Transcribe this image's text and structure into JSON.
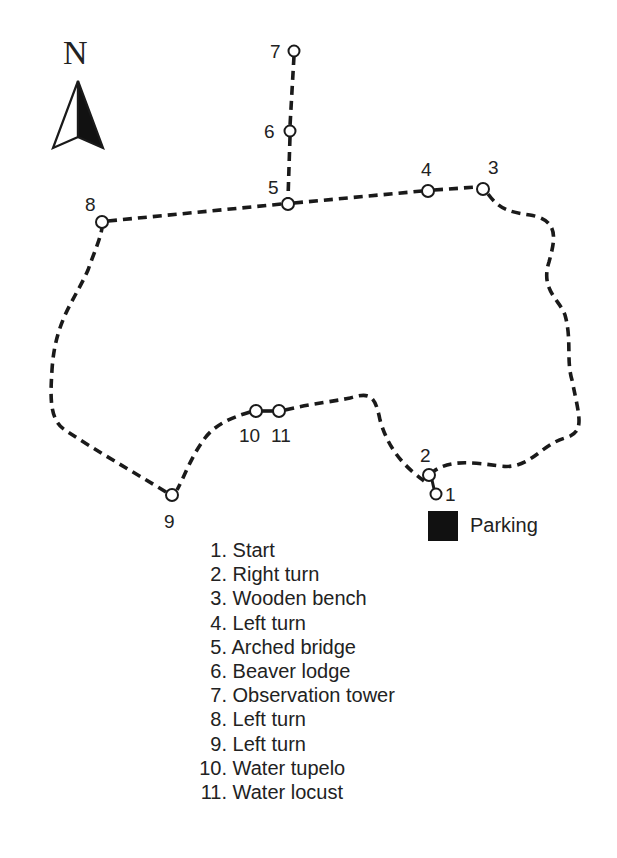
{
  "compass": {
    "label": "N",
    "icon": "north-arrow-icon"
  },
  "trail": {
    "points": [
      {
        "id": "1",
        "label": "1",
        "x": 436,
        "y": 494
      },
      {
        "id": "2",
        "label": "2",
        "x": 429,
        "y": 475
      },
      {
        "id": "3",
        "label": "3",
        "x": 483,
        "y": 189
      },
      {
        "id": "4",
        "label": "4",
        "x": 428,
        "y": 191
      },
      {
        "id": "5",
        "label": "5",
        "x": 288,
        "y": 204
      },
      {
        "id": "6",
        "label": "6",
        "x": 290,
        "y": 131
      },
      {
        "id": "7",
        "label": "7",
        "x": 294,
        "y": 51
      },
      {
        "id": "8",
        "label": "8",
        "x": 102,
        "y": 222
      },
      {
        "id": "9",
        "label": "9",
        "x": 172,
        "y": 495
      },
      {
        "id": "10",
        "label": "10",
        "x": 256,
        "y": 411
      },
      {
        "id": "11",
        "label": "11",
        "x": 279,
        "y": 411
      }
    ],
    "line_color": "#1a1a1a"
  },
  "parking": {
    "label": "Parking",
    "color": "#111111"
  },
  "legend": {
    "items": [
      {
        "num": "1.",
        "text": "Start"
      },
      {
        "num": "2.",
        "text": "Right turn"
      },
      {
        "num": "3.",
        "text": "Wooden bench"
      },
      {
        "num": "4.",
        "text": "Left turn"
      },
      {
        "num": "5.",
        "text": "Arched bridge"
      },
      {
        "num": "6.",
        "text": "Beaver lodge"
      },
      {
        "num": "7.",
        "text": "Observation tower"
      },
      {
        "num": "8.",
        "text": "Left turn"
      },
      {
        "num": "9.",
        "text": "Left turn"
      },
      {
        "num": "10.",
        "text": "Water tupelo"
      },
      {
        "num": "11.",
        "text": "Water locust"
      }
    ]
  }
}
